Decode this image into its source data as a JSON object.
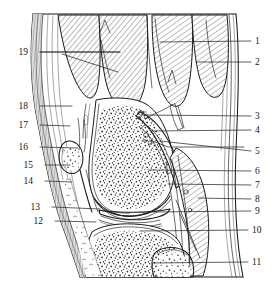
{
  "figure": {
    "kind": "anatomical-line-drawing",
    "width": 280,
    "height": 291,
    "background_color": "#ffffff",
    "ink_color": "#1a1a1a",
    "label_color": "#161616"
  },
  "labels_left": [
    {
      "id": "19",
      "text": "19",
      "x": 28,
      "y": 55,
      "leader_to_x": 120,
      "leader_to_y": 52
    },
    {
      "id": "18",
      "text": "18",
      "x": 28,
      "y": 109,
      "leader_to_x": 72,
      "leader_to_y": 106
    },
    {
      "id": "17",
      "text": "17",
      "x": 28,
      "y": 128,
      "leader_to_x": 70,
      "leader_to_y": 126
    },
    {
      "id": "16",
      "text": "16",
      "x": 28,
      "y": 150,
      "leader_to_x": 78,
      "leader_to_y": 148
    },
    {
      "id": "15",
      "text": "15",
      "x": 33,
      "y": 168,
      "leader_to_x": 70,
      "leader_to_y": 165
    },
    {
      "id": "14",
      "text": "14",
      "x": 33,
      "y": 184,
      "leader_to_x": 72,
      "leader_to_y": 182
    },
    {
      "id": "13",
      "text": "13",
      "x": 40,
      "y": 210,
      "leader_to_x": 100,
      "leader_to_y": 209
    },
    {
      "id": "12",
      "text": "12",
      "x": 43,
      "y": 224,
      "leader_to_x": 96,
      "leader_to_y": 222
    }
  ],
  "labels_right": [
    {
      "id": "1",
      "text": "1",
      "x": 255,
      "y": 44,
      "leader_to_x": 160,
      "leader_to_y": 42
    },
    {
      "id": "2",
      "text": "2",
      "x": 255,
      "y": 65,
      "leader_to_x": 196,
      "leader_to_y": 62
    },
    {
      "id": "3",
      "text": "3",
      "x": 255,
      "y": 119,
      "leader_to_x": 142,
      "leader_to_y": 115
    },
    {
      "id": "4",
      "text": "4",
      "x": 255,
      "y": 133,
      "leader_to_x": 152,
      "leader_to_y": 131
    },
    {
      "id": "5",
      "text": "5",
      "x": 255,
      "y": 154,
      "leader_to_x": 160,
      "leader_to_y": 141
    },
    {
      "id": "6",
      "text": "6",
      "x": 255,
      "y": 174,
      "leader_to_x": 148,
      "leader_to_y": 170
    },
    {
      "id": "7",
      "text": "7",
      "x": 255,
      "y": 188,
      "leader_to_x": 168,
      "leader_to_y": 184
    },
    {
      "id": "8",
      "text": "8",
      "x": 255,
      "y": 202,
      "leader_to_x": 198,
      "leader_to_y": 198
    },
    {
      "id": "9",
      "text": "9",
      "x": 255,
      "y": 214,
      "leader_to_x": 152,
      "leader_to_y": 212
    },
    {
      "id": "10",
      "text": "10",
      "x": 252,
      "y": 233,
      "leader_to_x": 140,
      "leader_to_y": 231
    },
    {
      "id": "11",
      "text": "11",
      "x": 252,
      "y": 265,
      "leader_to_x": 152,
      "leader_to_y": 263
    }
  ],
  "regions": [
    {
      "name": "quadriceps-muscle-belly-anterior",
      "fill": "hatch"
    },
    {
      "name": "quadriceps-muscle-belly-middle",
      "fill": "hatch"
    },
    {
      "name": "hamstring-muscle-belly-posterior",
      "fill": "hatch"
    },
    {
      "name": "gastrocnemius-muscle-belly",
      "fill": "hatch"
    },
    {
      "name": "femur-condyle-cancellous-bone",
      "fill": "stipple"
    },
    {
      "name": "tibia-plateau-cancellous-bone",
      "fill": "stipple"
    },
    {
      "name": "fibula-head-cancellous-bone",
      "fill": "stipple"
    },
    {
      "name": "patella-cancellous-bone",
      "fill": "stipple"
    },
    {
      "name": "infrapatellar-fat-pad",
      "fill": "loose-stipple"
    },
    {
      "name": "skin-and-subcutaneous-fascia",
      "fill": "parallel-lines"
    },
    {
      "name": "joint-cavity-articular-cartilage",
      "fill": "blank"
    }
  ]
}
